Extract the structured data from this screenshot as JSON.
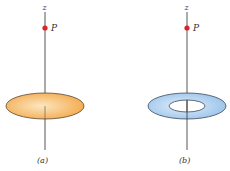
{
  "figure": {
    "panels": [
      {
        "id": "a",
        "caption": "(a)",
        "axis_label": "z",
        "point_label": "P",
        "shape": "disk",
        "fill_color": "#f4b45e",
        "highlight_color": "#fde6c0",
        "edge_color": "#5a4630"
      },
      {
        "id": "b",
        "caption": "(b)",
        "axis_label": "z",
        "point_label": "P",
        "shape": "ring",
        "fill_color": "#a9cdf0",
        "highlight_color": "#e3f0fb",
        "edge_color": "#3c4a5a"
      }
    ],
    "point_color": "#d9252a",
    "axis_color": "#444444"
  }
}
